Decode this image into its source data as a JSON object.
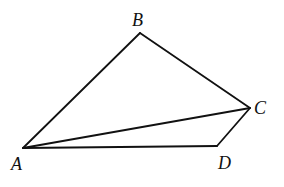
{
  "figure": {
    "type": "quadrilateral-with-diagonal",
    "stroke_color": "#111111",
    "background": "#ffffff",
    "vertices": {
      "A": {
        "label": "A",
        "x": 23,
        "y": 148
      },
      "B": {
        "label": "B",
        "x": 140,
        "y": 33
      },
      "C": {
        "label": "C",
        "x": 250,
        "y": 108
      },
      "D": {
        "label": "D",
        "x": 217,
        "y": 146
      }
    },
    "segments": [
      "AB",
      "BC",
      "CD",
      "DA",
      "AC"
    ]
  }
}
